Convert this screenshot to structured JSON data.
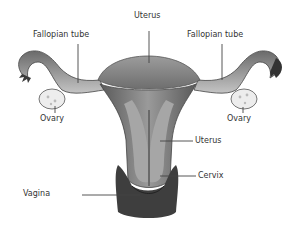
{
  "diagram": {
    "labels": {
      "uterus_top": "Uterus",
      "fallopian_left": "Fallopian tube",
      "fallopian_right": "Fallopian tube",
      "ovary_left": "Ovary",
      "ovary_right": "Ovary",
      "uterus_side": "Uterus",
      "cervix": "Cervix",
      "vagina": "Vagina"
    },
    "colors": {
      "background": "#ffffff",
      "tissue_light": "#b8b8b8",
      "tissue_mid": "#8a8a8a",
      "tissue_dark": "#4a4a4a",
      "ovary": "#e8e8e8",
      "leader_line": "#444444",
      "label_text": "#333333"
    }
  }
}
